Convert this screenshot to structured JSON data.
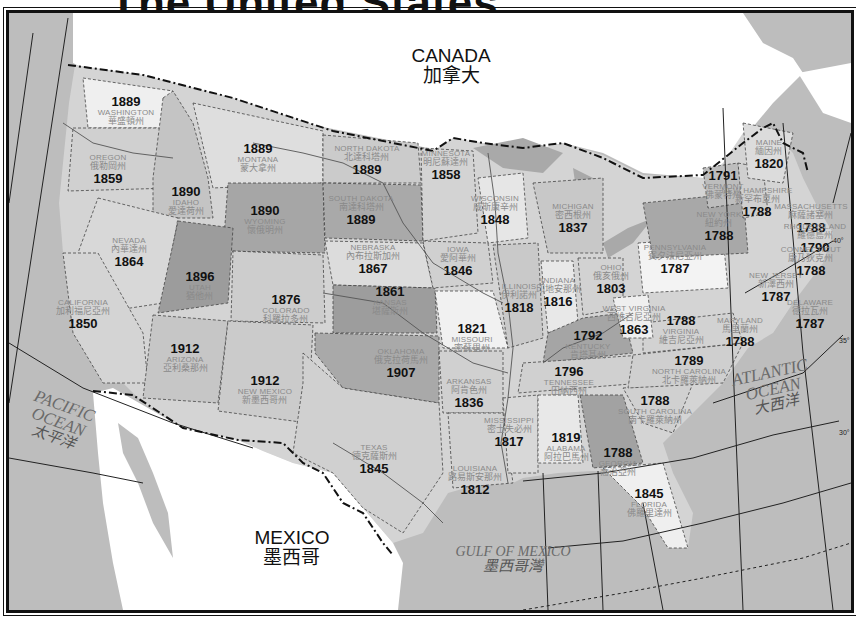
{
  "title": "The United States",
  "countries": [
    {
      "id": "canada",
      "en": "CANADA",
      "zh": "加拿大",
      "x": 448,
      "y": 63
    },
    {
      "id": "mexico",
      "en": "MEXICO",
      "zh": "墨西哥",
      "x": 289,
      "y": 545
    }
  ],
  "oceans": [
    {
      "id": "pacific",
      "en_line1": "PACIFIC",
      "en_line2": "OCEAN",
      "zh": "太平洋",
      "x": 55,
      "y": 418
    },
    {
      "id": "atlantic",
      "en_line1": "ATLANTIC",
      "en_line2": "OCEAN",
      "zh": "大西洋",
      "x": 770,
      "y": 385
    },
    {
      "id": "gulf",
      "en_line1": "GULF OF MEXICO",
      "en_line2": "",
      "zh": "墨西哥灣",
      "x": 510,
      "y": 556
    }
  ],
  "latitudes": [
    {
      "label": "40°",
      "x": 830,
      "y": 232
    },
    {
      "label": "35°",
      "x": 836,
      "y": 332
    },
    {
      "label": "30°",
      "x": 836,
      "y": 424
    }
  ],
  "states": [
    {
      "name": "WASHINGTON",
      "zh": "華盛頓州",
      "year": "1889",
      "x": 123,
      "y": 108,
      "year_first": true
    },
    {
      "name": "OREGON",
      "zh": "俄勒岡州",
      "year": "1859",
      "x": 105,
      "y": 167,
      "year_first": false
    },
    {
      "name": "IDAHO",
      "zh": "愛達荷州",
      "year": "1890",
      "x": 183,
      "y": 198,
      "year_first": true
    },
    {
      "name": "MONTANA",
      "zh": "蒙大拿州",
      "year": "1889",
      "x": 255,
      "y": 155,
      "year_first": true
    },
    {
      "name": "WYOMING",
      "zh": "懷俄明州",
      "year": "1890",
      "x": 262,
      "y": 217,
      "year_first": true
    },
    {
      "name": "NEVADA",
      "zh": "內華達州",
      "year": "1864",
      "x": 126,
      "y": 250,
      "year_first": false
    },
    {
      "name": "UTAH",
      "zh": "猶他州",
      "year": "1896",
      "x": 197,
      "y": 283,
      "year_first": true
    },
    {
      "name": "COLORADO",
      "zh": "科羅拉多州",
      "year": "1876",
      "x": 283,
      "y": 306,
      "year_first": true
    },
    {
      "name": "CALIFORNIA",
      "zh": "加利福尼亞州",
      "year": "1850",
      "x": 80,
      "y": 312,
      "year_first": false
    },
    {
      "name": "ARIZONA",
      "zh": "亞利桑那州",
      "year": "1912",
      "x": 182,
      "y": 355,
      "year_first": true
    },
    {
      "name": "NEW MEXICO",
      "zh": "新墨西哥州",
      "year": "1912",
      "x": 262,
      "y": 387,
      "year_first": true
    },
    {
      "name": "NORTH DAKOTA",
      "zh": "北達科塔州",
      "year": "1889",
      "x": 364,
      "y": 158,
      "year_first": false
    },
    {
      "name": "SOUTH DAKOTA",
      "zh": "南達科塔州",
      "year": "1889",
      "x": 358,
      "y": 208,
      "year_first": false
    },
    {
      "name": "NEBRASKA",
      "zh": "內布拉斯加州",
      "year": "1867",
      "x": 370,
      "y": 257,
      "year_first": false
    },
    {
      "name": "KANSAS",
      "zh": "堪薩斯州",
      "year": "1861",
      "x": 387,
      "y": 298,
      "year_first": true
    },
    {
      "name": "OKLAHOMA",
      "zh": "俄克拉荷馬州",
      "year": "1907",
      "x": 398,
      "y": 361,
      "year_first": false
    },
    {
      "name": "TEXAS",
      "zh": "德克薩斯州",
      "year": "1845",
      "x": 371,
      "y": 457,
      "year_first": false
    },
    {
      "name": "MINNESOTA",
      "zh": "明尼蘇達州",
      "year": "1858",
      "x": 443,
      "y": 163,
      "year_first": false
    },
    {
      "name": "IOWA",
      "zh": "愛阿華州",
      "year": "1846",
      "x": 455,
      "y": 259,
      "year_first": false
    },
    {
      "name": "MISSOURI",
      "zh": "密蘇里州",
      "year": "1821",
      "x": 469,
      "y": 335,
      "year_first": true
    },
    {
      "name": "ARKANSAS",
      "zh": "阿肯色州",
      "year": "1836",
      "x": 466,
      "y": 391,
      "year_first": false
    },
    {
      "name": "LOUISIANA",
      "zh": "路易斯安那州",
      "year": "1812",
      "x": 472,
      "y": 478,
      "year_first": false
    },
    {
      "name": "WISCONSIN",
      "zh": "威斯康辛州",
      "year": "1848",
      "x": 492,
      "y": 208,
      "year_first": false
    },
    {
      "name": "ILLINOIS",
      "zh": "伊利諾州",
      "year": "1818",
      "x": 516,
      "y": 296,
      "year_first": false
    },
    {
      "name": "MISSISSIPPI",
      "zh": "密士失必州",
      "year": "1817",
      "x": 506,
      "y": 430,
      "year_first": false
    },
    {
      "name": "MICHIGAN",
      "zh": "密西根州",
      "year": "1837",
      "x": 570,
      "y": 216,
      "year_first": false
    },
    {
      "name": "INDIANA",
      "zh": "印地安那州",
      "year": "1816",
      "x": 555,
      "y": 290,
      "year_first": false
    },
    {
      "name": "OHIO",
      "zh": "俄亥俄州",
      "year": "1803",
      "x": 608,
      "y": 277,
      "year_first": false
    },
    {
      "name": "KENTUCKY",
      "zh": "肯塔基州",
      "year": "1792",
      "x": 585,
      "y": 342,
      "year_first": true
    },
    {
      "name": "TENNESSEE",
      "zh": "田納西州",
      "year": "1796",
      "x": 566,
      "y": 378,
      "year_first": true
    },
    {
      "name": "ALABAMA",
      "zh": "阿拉巴馬州",
      "year": "1819",
      "x": 563,
      "y": 444,
      "year_first": true
    },
    {
      "name": "GEORGIA",
      "zh": "喬治亞州",
      "year": "1788",
      "x": 615,
      "y": 459,
      "year_first": true
    },
    {
      "name": "FLORIDA",
      "zh": "佛羅里達州",
      "year": "1845",
      "x": 646,
      "y": 500,
      "year_first": true
    },
    {
      "name": "SOUTH CAROLINA",
      "zh": "南卡羅萊納州",
      "year": "1788",
      "x": 652,
      "y": 407,
      "year_first": true
    },
    {
      "name": "NORTH CAROLINA",
      "zh": "北卡羅萊納州",
      "year": "1789",
      "x": 686,
      "y": 367,
      "year_first": true
    },
    {
      "name": "VIRGINIA",
      "zh": "維吉尼亞州",
      "year": "1788",
      "x": 678,
      "y": 327,
      "year_first": true
    },
    {
      "name": "WEST VIRGINIA",
      "zh": "西維吉尼亞州",
      "year": "1863",
      "x": 631,
      "y": 318,
      "year_first": false
    },
    {
      "name": "PENNSYLVANIA",
      "zh": "賓夕法尼亞州",
      "year": "1787",
      "x": 672,
      "y": 257,
      "year_first": false
    },
    {
      "name": "NEW YORK",
      "zh": "紐約州",
      "year": "1788",
      "x": 716,
      "y": 224,
      "year_first": false
    },
    {
      "name": "VERMONT",
      "zh": "佛蒙特州",
      "year": "1791",
      "x": 720,
      "y": 182,
      "year_first": true
    },
    {
      "name": "NEW HAMPSHIRE",
      "zh": "新罕布夏州",
      "year": "1788",
      "x": 754,
      "y": 200,
      "year_first": false
    },
    {
      "name": "MAINE",
      "zh": "緬因州",
      "year": "1820",
      "x": 766,
      "y": 152,
      "year_first": false
    },
    {
      "name": "MASSACHUSETTS",
      "zh": "麻薩諸塞州",
      "year": "1788",
      "x": 808,
      "y": 216,
      "year_first": false
    },
    {
      "name": "RHODE ISLAND",
      "zh": "羅德島州",
      "year": "1790",
      "x": 812,
      "y": 236,
      "year_first": false
    },
    {
      "name": "CONNECTICUT",
      "zh": "康乃狄克州",
      "year": "1788",
      "x": 808,
      "y": 259,
      "year_first": false
    },
    {
      "name": "NEW JERSEY",
      "zh": "新澤西州",
      "year": "1787",
      "x": 773,
      "y": 285,
      "year_first": false
    },
    {
      "name": "DELAWARE",
      "zh": "德拉瓦州",
      "year": "1787",
      "x": 807,
      "y": 312,
      "year_first": false
    },
    {
      "name": "MARYLAND",
      "zh": "馬里蘭州",
      "year": "1788",
      "x": 737,
      "y": 330,
      "year_first": false
    }
  ],
  "colors": {
    "frame": "#111111",
    "border_dashed": "#222222",
    "land_canada_mexico": "#ffffff",
    "water": "#bdbdbd",
    "shade_light": "#e6e6e6",
    "shade_mid": "#c8c8c8",
    "shade_dark": "#a8a8a8",
    "shade_darkest": "#969696"
  }
}
